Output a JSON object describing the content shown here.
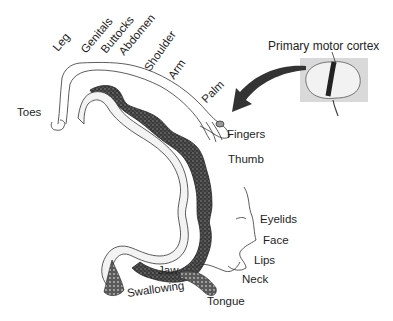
{
  "diagram": {
    "type": "motor-homunculus",
    "inset": {
      "title": "Primary motor cortex",
      "icon": "brain-icon",
      "arrow": "curved-arrow-icon"
    },
    "body_labels": [
      {
        "id": "toes",
        "text": "Toes"
      },
      {
        "id": "leg",
        "text": "Leg"
      },
      {
        "id": "genitals",
        "text": "Genitals"
      },
      {
        "id": "buttocks",
        "text": "Buttocks"
      },
      {
        "id": "abdomen",
        "text": "Abdomen"
      },
      {
        "id": "shoulder",
        "text": "Shoulder"
      },
      {
        "id": "arm",
        "text": "Arm"
      },
      {
        "id": "palm",
        "text": "Palm"
      },
      {
        "id": "fingers",
        "text": "Fingers"
      },
      {
        "id": "thumb",
        "text": "Thumb"
      },
      {
        "id": "eyelids",
        "text": "Eyelids"
      },
      {
        "id": "face",
        "text": "Face"
      },
      {
        "id": "lips",
        "text": "Lips"
      },
      {
        "id": "jaw",
        "text": "Jaw"
      },
      {
        "id": "neck",
        "text": "Neck"
      },
      {
        "id": "swallowing",
        "text": "Swallowing"
      },
      {
        "id": "tongue",
        "text": "Tongue"
      }
    ],
    "colors": {
      "cortex_dark": "#2a2a2a",
      "cortex_mid": "#7a7a7a",
      "white_matter": "#f4f4f4",
      "outline": "#333333",
      "inset_bg": "#d9d9d9"
    }
  }
}
